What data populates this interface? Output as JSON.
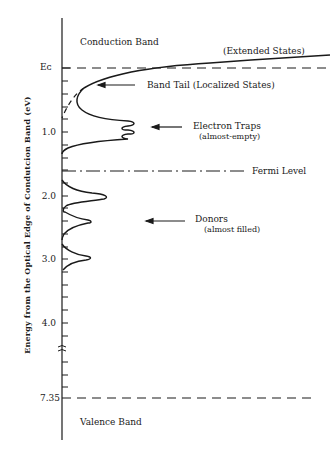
{
  "figure": {
    "ylabel": "Energy from the Optical Edge of Condutcion Band (eV)",
    "tick_labels": {
      "ec": "Eᴄ",
      "t1": "1.0",
      "t2": "2.0",
      "t3": "3.0",
      "t4": "4.0",
      "t735": "7.35"
    },
    "regions": {
      "conduction_band": "Conduction Band",
      "valence_band": "Valence Band"
    },
    "annotations": {
      "extended_states": "(Extended States)",
      "band_tail": "Band Tail (Localized States)",
      "electron_traps": "Electron Traps",
      "electron_traps_sub": "(almost-empty)",
      "fermi_level": "Fermi Level",
      "donors": "Donors",
      "donors_sub": "(almost filled)"
    },
    "colors": {
      "ink": "#1a1a1a",
      "background": "#ffffff"
    }
  },
  "diagram_data": {
    "type": "energy-band density-of-states diagram",
    "axis": {
      "direction": "downward",
      "unit": "eV",
      "ticks": [
        0,
        1.0,
        2.0,
        3.0,
        4.0,
        7.35
      ],
      "break_between": [
        4.0,
        7.35
      ]
    },
    "levels": [
      {
        "name": "Ec (conduction band edge)",
        "energy": 0,
        "style": "dashed"
      },
      {
        "name": "Fermi Level",
        "energy": 1.6,
        "style": "dash-dot"
      },
      {
        "name": "Valence band edge",
        "energy": 7.35,
        "style": "dashed"
      }
    ],
    "features": [
      {
        "name": "Extended States",
        "region": "above Ec"
      },
      {
        "name": "Band Tail (Localized States)",
        "region": "~0.2-0.5 eV"
      },
      {
        "name": "Electron Traps (almost-empty)",
        "region": "~0.8-1.0 eV"
      },
      {
        "name": "Donors (almost filled)",
        "peaks_eV": [
          2.0,
          2.4,
          2.95
        ]
      }
    ]
  }
}
